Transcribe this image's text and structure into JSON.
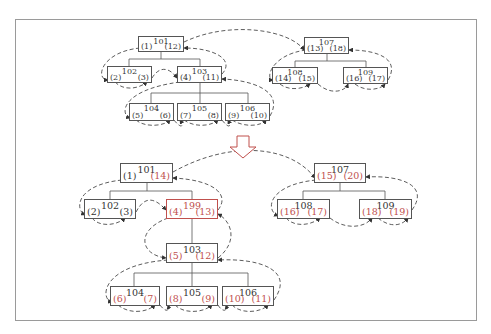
{
  "colors": {
    "line": "#555555",
    "highlight": "#c0504d",
    "frame": "#9a9a9a"
  },
  "arrow": {
    "icon": "down-arrow-icon",
    "color": "#c0504d"
  },
  "before_tree": {
    "nodes": {
      "n101": {
        "id": "101",
        "left": "(1)",
        "right": "(12)"
      },
      "n102": {
        "id": "102",
        "left": "(2)",
        "right": "(3)"
      },
      "n103": {
        "id": "103",
        "left": "(4)",
        "right": "(11)"
      },
      "n104": {
        "id": "104",
        "left": "(5)",
        "right": "(6)"
      },
      "n105": {
        "id": "105",
        "left": "(7)",
        "right": "(8)"
      },
      "n106": {
        "id": "106",
        "left": "(9)",
        "right": "(10)"
      },
      "n107": {
        "id": "107",
        "left": "(13)",
        "right": "(18)"
      },
      "n108": {
        "id": "108",
        "left": "(14)",
        "right": "(15)"
      },
      "n109": {
        "id": "109",
        "left": "(16)",
        "right": "(17)"
      }
    }
  },
  "after_tree": {
    "nodes": {
      "n101": {
        "id": "101",
        "left": "(1)",
        "right": "(14)"
      },
      "n102": {
        "id": "102",
        "left": "(2)",
        "right": "(3)"
      },
      "n199": {
        "id": "199",
        "left": "(4)",
        "right": "(13)"
      },
      "n103": {
        "id": "103",
        "left": "(5)",
        "right": "(12)"
      },
      "n104": {
        "id": "104",
        "left": "(6)",
        "right": "(7)"
      },
      "n105": {
        "id": "105",
        "left": "(8)",
        "right": "(9)"
      },
      "n106": {
        "id": "106",
        "left": "(10)",
        "right": "(11)"
      },
      "n107": {
        "id": "107",
        "left": "(15)",
        "right": "(20)"
      },
      "n108": {
        "id": "108",
        "left": "(16)",
        "right": "(17)"
      },
      "n109": {
        "id": "109",
        "left": "(18)",
        "right": "(19)"
      }
    }
  }
}
